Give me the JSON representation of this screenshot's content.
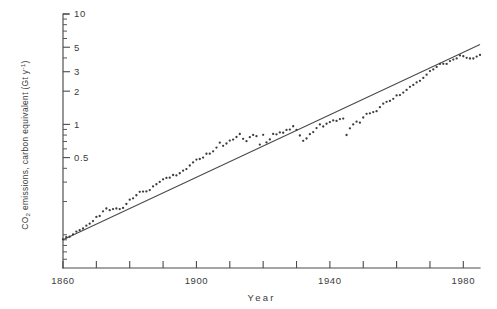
{
  "chart_data": {
    "type": "scatter",
    "title": "",
    "subtitle": "",
    "xlabel": "Year",
    "ylabel": "CO2 emissions, carbon equivalent (Gt y-1)",
    "ylabel_parts": {
      "prefix": "CO",
      "sub": "2",
      "mid": " emissions, carbon equivalent (Gt y",
      "sup": "-1",
      "suffix": ")"
    },
    "yscale": "log",
    "xscale": "linear",
    "grid": false,
    "legend": null,
    "xlim": [
      1860,
      1985
    ],
    "ylim": [
      0.05,
      10
    ],
    "xticks": [
      1860,
      1870,
      1880,
      1890,
      1900,
      1910,
      1920,
      1930,
      1940,
      1950,
      1960,
      1970,
      1980
    ],
    "xtick_labels_shown": [
      "1860",
      "1900",
      "1940",
      "1980"
    ],
    "xtick_label_values": [
      1860,
      1900,
      1940,
      1980
    ],
    "yticks": [
      0.5,
      1,
      2,
      3,
      5,
      10
    ],
    "ytick_labels_shown": [
      "0.5",
      "1",
      "2",
      "3",
      "5",
      "10"
    ],
    "yticks_minor": [
      0.06,
      0.07,
      0.08,
      0.09,
      0.1,
      0.2,
      0.3,
      0.4,
      0.6,
      0.7,
      0.8,
      0.9,
      4,
      6,
      7,
      8,
      9
    ],
    "trend_line": {
      "label": "exponential fit",
      "x": [
        1860,
        1985
      ],
      "y": [
        0.09,
        5.3
      ]
    },
    "series": [
      {
        "name": "CO2 emissions, carbon equivalent",
        "marker": "dot",
        "x": [
          1860,
          1861,
          1862,
          1863,
          1864,
          1865,
          1866,
          1867,
          1868,
          1869,
          1870,
          1871,
          1872,
          1873,
          1874,
          1875,
          1876,
          1877,
          1878,
          1879,
          1880,
          1881,
          1882,
          1883,
          1884,
          1885,
          1886,
          1887,
          1888,
          1889,
          1890,
          1891,
          1892,
          1893,
          1894,
          1895,
          1896,
          1897,
          1898,
          1899,
          1900,
          1901,
          1902,
          1903,
          1904,
          1905,
          1906,
          1907,
          1908,
          1909,
          1910,
          1911,
          1912,
          1913,
          1914,
          1915,
          1916,
          1917,
          1918,
          1919,
          1920,
          1921,
          1922,
          1923,
          1924,
          1925,
          1926,
          1927,
          1928,
          1929,
          1930,
          1931,
          1932,
          1933,
          1934,
          1935,
          1936,
          1937,
          1938,
          1939,
          1940,
          1941,
          1942,
          1943,
          1944,
          1945,
          1946,
          1947,
          1948,
          1949,
          1950,
          1951,
          1952,
          1953,
          1954,
          1955,
          1956,
          1957,
          1958,
          1959,
          1960,
          1961,
          1962,
          1963,
          1964,
          1965,
          1966,
          1967,
          1968,
          1969,
          1970,
          1971,
          1972,
          1973,
          1974,
          1975,
          1976,
          1977,
          1978,
          1979,
          1980,
          1981,
          1982,
          1983,
          1984,
          1985
        ],
        "y": [
          0.091,
          0.095,
          0.096,
          0.101,
          0.107,
          0.11,
          0.114,
          0.121,
          0.126,
          0.133,
          0.145,
          0.148,
          0.163,
          0.173,
          0.167,
          0.171,
          0.173,
          0.171,
          0.175,
          0.19,
          0.208,
          0.214,
          0.228,
          0.245,
          0.246,
          0.247,
          0.254,
          0.274,
          0.287,
          0.301,
          0.318,
          0.327,
          0.329,
          0.348,
          0.345,
          0.361,
          0.381,
          0.394,
          0.424,
          0.452,
          0.48,
          0.486,
          0.5,
          0.542,
          0.543,
          0.57,
          0.616,
          0.683,
          0.64,
          0.671,
          0.714,
          0.728,
          0.769,
          0.818,
          0.74,
          0.705,
          0.766,
          0.803,
          0.782,
          0.656,
          0.805,
          0.686,
          0.731,
          0.819,
          0.812,
          0.846,
          0.84,
          0.89,
          0.897,
          0.962,
          0.893,
          0.793,
          0.709,
          0.745,
          0.815,
          0.852,
          0.925,
          0.999,
          0.957,
          1.013,
          1.049,
          1.086,
          1.075,
          1.118,
          1.128,
          0.801,
          0.921,
          1.0,
          1.059,
          1.036,
          1.155,
          1.246,
          1.259,
          1.293,
          1.317,
          1.432,
          1.539,
          1.601,
          1.632,
          1.703,
          1.829,
          1.844,
          1.943,
          2.052,
          2.189,
          2.276,
          2.402,
          2.48,
          2.633,
          2.822,
          3.038,
          3.146,
          3.313,
          3.531,
          3.536,
          3.533,
          3.746,
          3.868,
          3.96,
          4.216,
          4.143,
          4.009,
          3.954,
          3.953,
          4.116,
          4.255
        ]
      }
    ],
    "annotations": []
  },
  "axis": {
    "x_tick_labels": [
      {
        "value": 1860,
        "text": "1860"
      },
      {
        "value": 1900,
        "text": "1900"
      },
      {
        "value": 1940,
        "text": "1940"
      },
      {
        "value": 1980,
        "text": "1980"
      }
    ],
    "y_tick_labels": [
      {
        "value": 10,
        "text": "10"
      },
      {
        "value": 5,
        "text": "5"
      },
      {
        "value": 3,
        "text": "3"
      },
      {
        "value": 2,
        "text": "2"
      },
      {
        "value": 1,
        "text": "1"
      },
      {
        "value": 0.5,
        "text": "0.5"
      }
    ]
  }
}
